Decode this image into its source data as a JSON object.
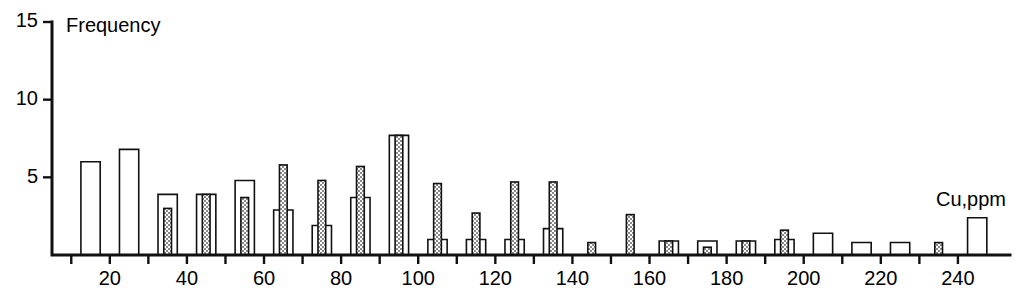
{
  "chart_data": {
    "type": "bar",
    "title": "",
    "subtitle": "",
    "xlabel": "Cu,ppm",
    "ylabel": "Frequency",
    "grid": false,
    "legend": "none",
    "xlim": [
      5,
      250
    ],
    "ylim": [
      0,
      15
    ],
    "bin_width": 5,
    "y_ticks": [
      5,
      10,
      15
    ],
    "y_tick_labels": [
      "5",
      "10",
      "15"
    ],
    "x_ticks": [
      10,
      20,
      30,
      40,
      50,
      60,
      70,
      80,
      90,
      100,
      110,
      120,
      130,
      140,
      150,
      160,
      170,
      180,
      190,
      200,
      210,
      220,
      230,
      240
    ],
    "x_tick_labels_shown": [
      "20",
      "40",
      "60",
      "80",
      "100",
      "120",
      "140",
      "160",
      "180",
      "200",
      "220",
      "240"
    ],
    "x_labeled_values": [
      20,
      40,
      60,
      80,
      100,
      120,
      140,
      160,
      180,
      200,
      220,
      240
    ],
    "series": [
      {
        "name": "open",
        "fill": "white",
        "width_units": 5,
        "bins": [
          {
            "x": 15,
            "value": 6
          },
          {
            "x": 25,
            "value": 6.8
          },
          {
            "x": 35,
            "value": 3.9
          },
          {
            "x": 45,
            "value": 3.9
          },
          {
            "x": 55,
            "value": 4.8
          },
          {
            "x": 65,
            "value": 2.9
          },
          {
            "x": 75,
            "value": 1.9
          },
          {
            "x": 85,
            "value": 3.7
          },
          {
            "x": 95,
            "value": 7.7
          },
          {
            "x": 105,
            "value": 1.0
          },
          {
            "x": 115,
            "value": 1.0
          },
          {
            "x": 125,
            "value": 1.0
          },
          {
            "x": 135,
            "value": 1.7
          },
          {
            "x": 165,
            "value": 0.9
          },
          {
            "x": 175,
            "value": 0.9
          },
          {
            "x": 185,
            "value": 0.9
          },
          {
            "x": 195,
            "value": 1.0
          },
          {
            "x": 205,
            "value": 1.4
          },
          {
            "x": 215,
            "value": 0.8
          },
          {
            "x": 225,
            "value": 0.8
          },
          {
            "x": 245,
            "value": 2.4
          }
        ]
      },
      {
        "name": "hatched",
        "fill": "hatch",
        "width_units": 2,
        "bins": [
          {
            "x": 35,
            "value": 3.0
          },
          {
            "x": 45,
            "value": 3.9
          },
          {
            "x": 55,
            "value": 3.7
          },
          {
            "x": 65,
            "value": 5.8
          },
          {
            "x": 75,
            "value": 4.8
          },
          {
            "x": 85,
            "value": 5.7
          },
          {
            "x": 95,
            "value": 7.7
          },
          {
            "x": 105,
            "value": 4.6
          },
          {
            "x": 115,
            "value": 2.7
          },
          {
            "x": 125,
            "value": 4.7
          },
          {
            "x": 135,
            "value": 4.7
          },
          {
            "x": 145,
            "value": 0.8
          },
          {
            "x": 155,
            "value": 2.6
          },
          {
            "x": 165,
            "value": 0.9
          },
          {
            "x": 175,
            "value": 0.5
          },
          {
            "x": 185,
            "value": 0.9
          },
          {
            "x": 195,
            "value": 1.6
          },
          {
            "x": 235,
            "value": 0.8
          }
        ]
      }
    ]
  }
}
